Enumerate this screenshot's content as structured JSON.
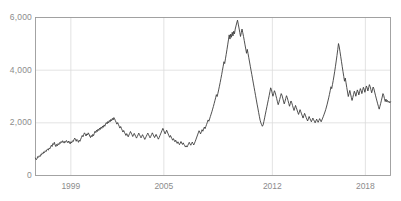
{
  "chart_data": {
    "type": "line",
    "title": "",
    "subtitle": "",
    "xlabel": "",
    "ylabel": "",
    "xlim": [
      1996.7,
      1209.6
    ],
    "ylim": [
      0,
      6000
    ],
    "grid": true,
    "legend": null,
    "legend_position": "none",
    "series_color": "#3c3c3c",
    "grid_color": "#dcdcdc",
    "axis_color": "#9a9a9a",
    "tick_label_color": "#8c8c8c",
    "y_ticks": [
      {
        "value": 0,
        "label": "0"
      },
      {
        "value": 2000,
        "label": "2,000"
      },
      {
        "value": 4000,
        "label": "4,000"
      },
      {
        "value": 6000,
        "label": "6,000"
      }
    ],
    "x_ticks": [
      {
        "value": 1999,
        "label": "1999"
      },
      {
        "value": 2005,
        "label": "2005"
      },
      {
        "value": 2012,
        "label": "2012"
      },
      {
        "value": 2018,
        "label": "2018"
      }
    ],
    "x_start": 1996.72,
    "x_end": 2019.62,
    "series": [
      {
        "name": "index",
        "color": "#3c3c3c",
        "values": [
          660,
          600,
          640,
          720,
          690,
          750,
          720,
          800,
          780,
          860,
          830,
          900,
          870,
          940,
          910,
          980,
          1000,
          960,
          1040,
          1010,
          1090,
          1150,
          1100,
          1210,
          1180,
          1260,
          1160,
          1100,
          1180,
          1130,
          1210,
          1170,
          1250,
          1220,
          1290,
          1250,
          1320,
          1280,
          1230,
          1300,
          1260,
          1330,
          1290,
          1240,
          1310,
          1270,
          1200,
          1280,
          1240,
          1320,
          1290,
          1360,
          1420,
          1380,
          1300,
          1370,
          1330,
          1260,
          1340,
          1300,
          1380,
          1450,
          1520,
          1470,
          1560,
          1620,
          1570,
          1500,
          1580,
          1540,
          1620,
          1570,
          1500,
          1440,
          1520,
          1470,
          1560,
          1510,
          1600,
          1680,
          1630,
          1720,
          1670,
          1760,
          1710,
          1800,
          1750,
          1840,
          1790,
          1880,
          1830,
          1920,
          1870,
          1960,
          2010,
          1960,
          2050,
          2000,
          2090,
          2040,
          2130,
          2080,
          2170,
          2110,
          2200,
          2150,
          2080,
          2020,
          1950,
          2010,
          1940,
          1870,
          1800,
          1860,
          1790,
          1720,
          1650,
          1710,
          1640,
          1580,
          1520,
          1590,
          1530,
          1470,
          1540,
          1600,
          1670,
          1610,
          1550,
          1480,
          1540,
          1600,
          1540,
          1480,
          1420,
          1480,
          1540,
          1610,
          1550,
          1490,
          1430,
          1490,
          1550,
          1490,
          1430,
          1370,
          1430,
          1490,
          1550,
          1610,
          1550,
          1490,
          1430,
          1490,
          1550,
          1620,
          1560,
          1500,
          1440,
          1500,
          1560,
          1500,
          1440,
          1380,
          1440,
          1510,
          1580,
          1650,
          1720,
          1790,
          1720,
          1650,
          1580,
          1650,
          1720,
          1650,
          1580,
          1510,
          1450,
          1520,
          1460,
          1400,
          1340,
          1400,
          1340,
          1280,
          1340,
          1280,
          1220,
          1280,
          1220,
          1170,
          1230,
          1290,
          1230,
          1180,
          1240,
          1180,
          1130,
          1080,
          1130,
          1080,
          1140,
          1200,
          1260,
          1200,
          1150,
          1210,
          1270,
          1210,
          1160,
          1230,
          1300,
          1380,
          1460,
          1540,
          1620,
          1700,
          1640,
          1580,
          1660,
          1740,
          1680,
          1760,
          1840,
          1780,
          1860,
          1940,
          2020,
          2110,
          2060,
          2150,
          2240,
          2330,
          2420,
          2520,
          2620,
          2730,
          2840,
          2950,
          3070,
          3000,
          3120,
          3250,
          3390,
          3530,
          3680,
          3830,
          3990,
          4150,
          4320,
          4250,
          4430,
          4600,
          4780,
          4960,
          5150,
          5340,
          5180,
          5370,
          5250,
          5440,
          5300,
          5480,
          5380,
          5560,
          5680,
          5790,
          5900,
          5750,
          5600,
          5440,
          5280,
          5420,
          5560,
          5420,
          5280,
          5120,
          4960,
          4800,
          4640,
          4790,
          4630,
          4470,
          4310,
          4150,
          3990,
          3830,
          3670,
          3510,
          3350,
          3190,
          3030,
          2870,
          2710,
          2560,
          2400,
          2250,
          2100,
          2000,
          1930,
          1870,
          1920,
          2050,
          2190,
          2330,
          2470,
          2610,
          2750,
          2890,
          3030,
          3180,
          3330,
          3260,
          3130,
          3010,
          3110,
          3220,
          3150,
          3030,
          2920,
          2800,
          2690,
          2780,
          2890,
          3000,
          3110,
          3050,
          2940,
          2830,
          2720,
          2810,
          2920,
          3030,
          2960,
          2850,
          2740,
          2630,
          2730,
          2830,
          2760,
          2660,
          2560,
          2470,
          2560,
          2660,
          2580,
          2490,
          2400,
          2320,
          2410,
          2500,
          2420,
          2340,
          2260,
          2180,
          2270,
          2360,
          2290,
          2210,
          2140,
          2070,
          2150,
          2240,
          2170,
          2100,
          2040,
          2110,
          2180,
          2120,
          2060,
          2000,
          2070,
          2140,
          2080,
          2020,
          2090,
          2160,
          2100,
          2040,
          2110,
          2180,
          2250,
          2330,
          2410,
          2500,
          2600,
          2710,
          2830,
          2950,
          3080,
          3220,
          3370,
          3300,
          3450,
          3610,
          3780,
          3960,
          4150,
          4350,
          4560,
          4780,
          5010,
          4880,
          4700,
          4510,
          4320,
          4130,
          3940,
          3760,
          3580,
          3700,
          3520,
          3340,
          3170,
          3000,
          3110,
          3230,
          3100,
          2970,
          2850,
          2960,
          3080,
          3200,
          3130,
          3010,
          3130,
          3250,
          3180,
          3060,
          3180,
          3300,
          3230,
          3110,
          3230,
          3350,
          3280,
          3160,
          3280,
          3400,
          3330,
          3210,
          3330,
          3450,
          3380,
          3260,
          3140,
          3250,
          3360,
          3290,
          3170,
          3050,
          2940,
          2830,
          2720,
          2620,
          2520,
          2630,
          2740,
          2860,
          2980,
          3110,
          3040,
          2920,
          2810,
          2900,
          2800,
          2850,
          2780,
          2820,
          2760,
          2800
        ]
      }
    ]
  },
  "axis": {
    "y_tick_labels": [
      "6,000",
      "4,000",
      "2,000",
      "0"
    ],
    "x_tick_labels": [
      "1999",
      "2005",
      "2012",
      "2018"
    ]
  }
}
